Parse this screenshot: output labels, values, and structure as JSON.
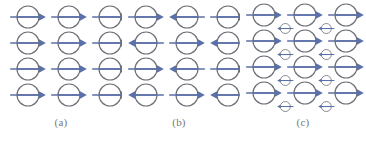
{
  "figure": {
    "background_color": "#ffffff",
    "width": 366,
    "height": 143
  },
  "style": {
    "circle_stroke": "#6b6f76",
    "circle_fill_top": "#eef4fa",
    "circle_fill_bottom": "#c8dcee",
    "arrow_color": "#5b6fa8",
    "caption_color": "#777777"
  },
  "panels": [
    {
      "id": "a",
      "caption": "(a)",
      "type": "ferromagnetic",
      "rows": 4,
      "columns": 3,
      "circle_radius": 11,
      "arrow_directions": [
        [
          "right",
          "right",
          "right"
        ],
        [
          "right",
          "right",
          "right"
        ],
        [
          "right",
          "right",
          "right"
        ],
        [
          "right",
          "right",
          "right"
        ]
      ]
    },
    {
      "id": "b",
      "caption": "(b)",
      "type": "antiferromagnetic",
      "rows": 4,
      "columns": 3,
      "circle_radius": 11,
      "arrow_directions": [
        [
          "right",
          "left",
          "right"
        ],
        [
          "left",
          "right",
          "left"
        ],
        [
          "right",
          "left",
          "right"
        ],
        [
          "left",
          "right",
          "left"
        ]
      ]
    },
    {
      "id": "c",
      "caption": "(c)",
      "type": "ferrimagnetic",
      "rows": 4,
      "columns": 3,
      "large_circle_radius": 11,
      "small_circle_radius": 5,
      "large_arrow_directions": [
        [
          "right",
          "right",
          "right"
        ],
        [
          "right",
          "right",
          "right"
        ],
        [
          "right",
          "right",
          "right"
        ],
        [
          "right",
          "right",
          "right"
        ]
      ],
      "small_rows": 4,
      "small_columns": 2,
      "small_arrow_directions": [
        [
          "left",
          "left"
        ],
        [
          "left",
          "left"
        ],
        [
          "left",
          "left"
        ],
        [
          "left",
          "left"
        ]
      ]
    }
  ]
}
